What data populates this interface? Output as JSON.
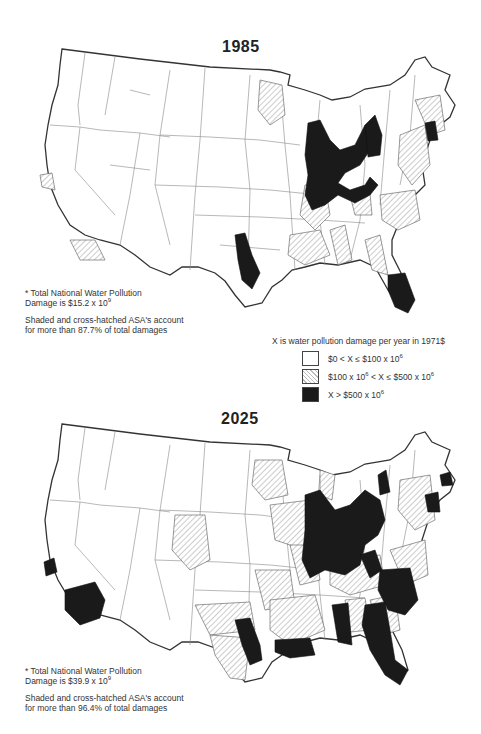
{
  "maps": [
    {
      "year": "1985",
      "note_line1": "* Total National Water Pollution",
      "note_line2_prefix": "Damage is $15.2 x 10",
      "note_line2_exp": "9",
      "note_line3": "Shaded and cross-hatched ASA's account",
      "note_line4": "for more than 87.7%  of total damages"
    },
    {
      "year": "2025",
      "note_line1": "* Total National Water Pollution",
      "note_line2_prefix": "Damage is $39.9 x 10",
      "note_line2_exp": "9",
      "note_line3": "Shaded and cross-hatched ASA's account",
      "note_line4": "for more than 96.4%  of total damages"
    }
  ],
  "legend": {
    "title": "X is water pollution damage per year in 1971$",
    "items": [
      {
        "fill": "white",
        "label_a": "$0 < X ≤ $100 x 10",
        "exp_a": "6",
        "label_b": "",
        "exp_b": ""
      },
      {
        "fill": "hatched",
        "label_a": "$100 x 10",
        "exp_a": "6",
        "label_b": " < X ≤ $500 x 10",
        "exp_b": "6"
      },
      {
        "fill": "black",
        "label_a": "X > $500 x 10",
        "exp_a": "6",
        "label_b": "",
        "exp_b": ""
      }
    ]
  },
  "colors": {
    "low": "#ffffff",
    "medium": "#bbbbbb",
    "high": "#1a1a1a",
    "outline": "#333333"
  }
}
